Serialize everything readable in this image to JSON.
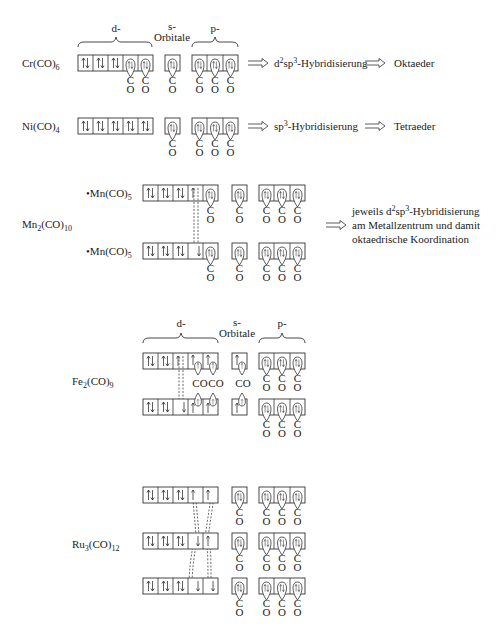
{
  "headers": {
    "d": "d-",
    "s_top": "s-",
    "s_bottom": "Orbitale",
    "p": "p-"
  },
  "ligand": {
    "c": "C",
    "o": "O",
    "co": "CO"
  },
  "implication_arrow": "⟹",
  "rows": [
    {
      "id": "cr",
      "formula": "Cr(CO)",
      "formula_sub": "6",
      "result_prefix": "d",
      "result_sup1": "2",
      "result_mid": "sp",
      "result_sup2": "3",
      "result_suffix": "-Hybridisierung",
      "geometry": "Oktaeder"
    },
    {
      "id": "ni",
      "formula": "Ni(CO)",
      "formula_sub": "4",
      "result_prefix": "",
      "result_mid": "sp",
      "result_sup2": "3",
      "result_suffix": "-Hybridisierung",
      "geometry": "Tetraeder"
    },
    {
      "id": "mn",
      "formula": "Mn",
      "formula_sub1": "2",
      "formula_mid": "(CO)",
      "formula_sub2": "10",
      "fragment": "•Mn(CO)",
      "fragment_sub": "5",
      "note_line1_a": "jeweils d",
      "note_line1_sup1": "2",
      "note_line1_b": "sp",
      "note_line1_sup2": "3",
      "note_line1_c": "-Hybridisierung",
      "note_line2": "am Metallzentrum und damit",
      "note_line3": "oktaedrische Koordination"
    },
    {
      "id": "fe",
      "formula": "Fe",
      "formula_sub1": "2",
      "formula_mid": "(CO)",
      "formula_sub2": "9"
    },
    {
      "id": "ru",
      "formula": "Ru",
      "formula_sub1": "3",
      "formula_mid": "(CO)",
      "formula_sub2": "12"
    }
  ]
}
